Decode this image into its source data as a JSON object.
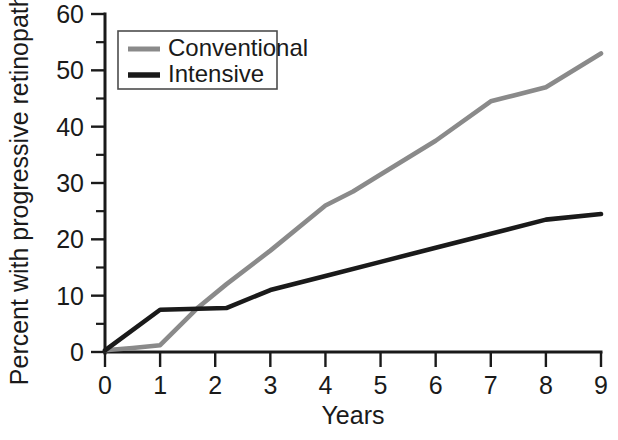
{
  "chart_data": {
    "type": "line",
    "title": "",
    "xlabel": "Years",
    "ylabel": "Percent with progressive retinopathy",
    "xlim": [
      0,
      9
    ],
    "ylim": [
      0,
      60
    ],
    "grid": false,
    "legend_position": "top-left",
    "x_ticks": [
      "0",
      "1",
      "2",
      "3",
      "4",
      "5",
      "6",
      "7",
      "8",
      "9"
    ],
    "y_ticks": [
      "0",
      "10",
      "20",
      "30",
      "40",
      "50",
      "60"
    ],
    "y_minor_ticks": [
      5,
      15,
      25,
      35,
      45,
      55
    ],
    "series": [
      {
        "name": "Conventional",
        "color": "#8a8a8a",
        "width": 4.6,
        "x": [
          0,
          0.5,
          1,
          1.7,
          2.2,
          3,
          4,
          4.5,
          5,
          6,
          7,
          7.4,
          8,
          9
        ],
        "values": [
          0.3,
          0.7,
          1.2,
          8.0,
          12.0,
          18.0,
          26.0,
          28.5,
          31.5,
          37.5,
          44.5,
          45.5,
          47.0,
          53.0
        ]
      },
      {
        "name": "Intensive",
        "color": "#1a1a1a",
        "width": 4.6,
        "x": [
          0,
          1,
          2.2,
          3,
          4,
          5,
          6,
          7,
          8,
          9
        ],
        "values": [
          0.3,
          7.5,
          7.8,
          11.0,
          13.5,
          16.0,
          18.5,
          21.0,
          23.5,
          24.5
        ]
      }
    ]
  },
  "legend": {
    "entries": [
      {
        "label": "Conventional",
        "color": "#8a8a8a"
      },
      {
        "label": "Intensive",
        "color": "#1a1a1a"
      }
    ]
  }
}
